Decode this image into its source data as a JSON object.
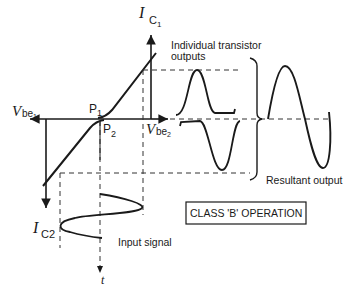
{
  "labels": {
    "ic1_main": "I",
    "ic1_sub": "C",
    "ic1_subsub": "1",
    "ic2_main": "I",
    "ic2_sub": "C2",
    "vbe1_main": "V",
    "vbe1_sub": "be",
    "vbe1_subsub": "1",
    "vbe2_main": "V",
    "vbe2_sub": "be",
    "vbe2_subsub": "2",
    "p1_main": "P",
    "p1_sub": "1",
    "p2_main": "P",
    "p2_sub": "2",
    "time_axis": "t",
    "individual_outputs_line1": "Individual transistor",
    "individual_outputs_line2": "outputs",
    "resultant_output": "Resultant output",
    "input_signal": "Input signal",
    "class_box": "CLASS 'B' OPERATION"
  },
  "colors": {
    "ink": "#1a1a1a",
    "background": "#ffffff"
  }
}
